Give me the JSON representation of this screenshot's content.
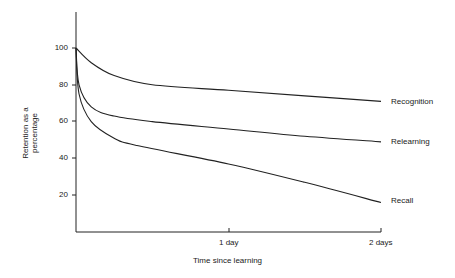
{
  "chart_data": {
    "type": "line",
    "title": "",
    "xlabel": "Time since learning",
    "ylabel": "Retention as a percentage",
    "x_ticks": [
      "1 day",
      "2 days"
    ],
    "y_ticks": [
      "100",
      "80",
      "60",
      "40",
      "20"
    ],
    "xlim": [
      0,
      2
    ],
    "ylim": [
      0,
      120
    ],
    "grid": false,
    "legend_position": "inline-right",
    "x_unit": "days",
    "series": [
      {
        "name": "Recognition",
        "x": [
          0,
          0.1,
          0.25,
          0.5,
          1,
          1.5,
          2
        ],
        "values": [
          100,
          92,
          85,
          80,
          77,
          74,
          71
        ]
      },
      {
        "name": "Relearning",
        "x": [
          0,
          0.02,
          0.1,
          0.25,
          0.5,
          1,
          1.5,
          2
        ],
        "values": [
          100,
          80,
          68,
          63,
          60,
          56,
          52,
          49
        ]
      },
      {
        "name": "Recall",
        "x": [
          0,
          0.02,
          0.1,
          0.25,
          0.4,
          1,
          1.5,
          2
        ],
        "values": [
          100,
          75,
          60,
          51,
          47,
          37,
          27,
          16
        ]
      }
    ]
  }
}
